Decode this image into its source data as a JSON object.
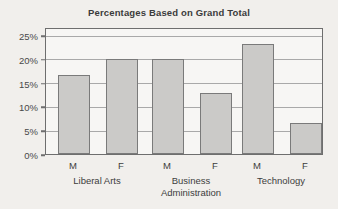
{
  "chart_data": {
    "type": "bar",
    "title": "Percentages Based on Grand Total",
    "xlabel": "",
    "ylabel": "",
    "ylim": [
      0,
      26.7
    ],
    "ytick_labels": [
      "0%",
      "5%",
      "10%",
      "15%",
      "20%",
      "25%"
    ],
    "ytick_values": [
      0,
      5,
      10,
      15,
      20,
      25
    ],
    "grid": true,
    "legend": "none",
    "categories": [
      "Liberal Arts",
      "Business Administration",
      "Technology"
    ],
    "series_labels": [
      "M",
      "F"
    ],
    "series": [
      {
        "name": "M",
        "values": [
          16.7,
          20.0,
          23.1
        ]
      },
      {
        "name": "F",
        "values": [
          20.0,
          12.8,
          6.6
        ]
      }
    ],
    "bars": [
      {
        "id": "bar-liberal-arts-m",
        "group": "Liberal Arts",
        "series": "M",
        "value": 16.7
      },
      {
        "id": "bar-liberal-arts-f",
        "group": "Liberal Arts",
        "series": "F",
        "value": 20.0
      },
      {
        "id": "bar-business-administration-m",
        "group": "Business Administration",
        "series": "M",
        "value": 20.0
      },
      {
        "id": "bar-business-administration-f",
        "group": "Business Administration",
        "series": "F",
        "value": 12.8
      },
      {
        "id": "bar-technology-m",
        "group": "Technology",
        "series": "M",
        "value": 23.1
      },
      {
        "id": "bar-technology-f",
        "group": "Technology",
        "series": "F",
        "value": 6.6
      }
    ],
    "group_label_lines": [
      [
        "Liberal Arts"
      ],
      [
        "Business",
        "Administration"
      ],
      [
        "Technology"
      ]
    ],
    "colors": {
      "background": "#f1efec",
      "plot_background": "#f7f6f4",
      "bar_fill": "#cbcac8",
      "bar_border": "#7a7a7a",
      "axis": "#6e6e6e",
      "gridline": "#a9a9a9",
      "text": "#3d3d3d",
      "title_text": "#3b3b3b"
    }
  }
}
